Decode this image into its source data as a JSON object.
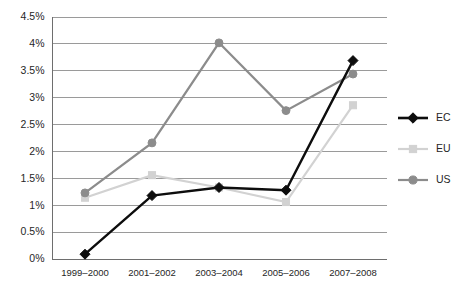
{
  "chart_data": {
    "type": "line",
    "title": "",
    "subtitle": "",
    "xlabel": "",
    "ylabel": "",
    "categories": [
      "1999–2000",
      "2001–2002",
      "2003–2004",
      "2005–2006",
      "2007–2008"
    ],
    "ylim": [
      0,
      4.5
    ],
    "y_tick_values": [
      0,
      0.5,
      1,
      1.5,
      2,
      2.5,
      3,
      3.5,
      4,
      4.5
    ],
    "y_tick_labels": [
      "0%",
      "0.5%",
      "1%",
      "1.5%",
      "2%",
      "2.5%",
      "3%",
      "3.5%",
      "4%",
      "4.5%"
    ],
    "y_unit": "%",
    "grid": true,
    "grid_axis": "y",
    "legend_position": "right",
    "series": [
      {
        "name": "EC",
        "color": "#0d0d0d",
        "marker": "diamond",
        "values": [
          0.08,
          1.17,
          1.32,
          1.27,
          3.68
        ]
      },
      {
        "name": "EU",
        "color": "#d2d2d2",
        "marker": "square",
        "values": [
          1.13,
          1.55,
          1.32,
          1.05,
          2.85
        ]
      },
      {
        "name": "US",
        "color": "#8c8c8c",
        "marker": "circle",
        "values": [
          1.22,
          2.15,
          4.01,
          2.75,
          3.43
        ]
      }
    ],
    "annotations": []
  },
  "legend": {
    "items": [
      {
        "label": "EC"
      },
      {
        "label": "EU"
      },
      {
        "label": "US"
      }
    ]
  },
  "caption": {
    "text": ""
  }
}
